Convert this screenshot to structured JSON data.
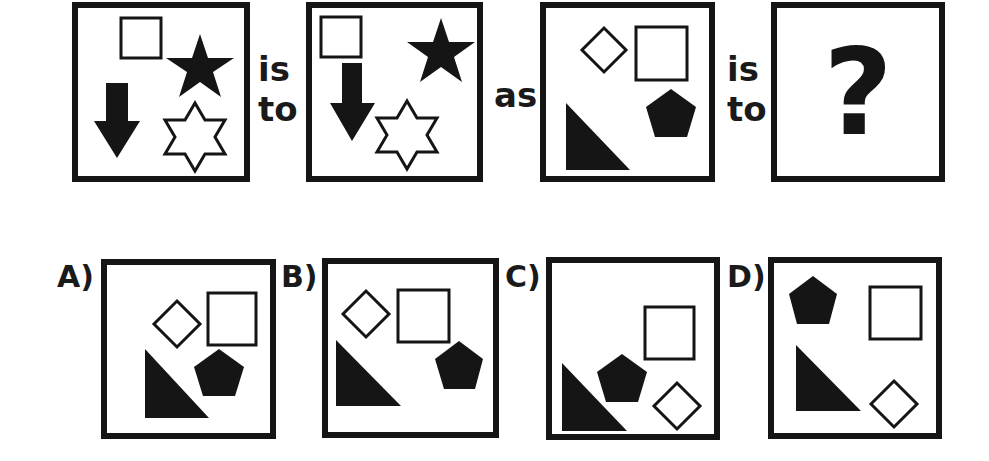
{
  "puzzle": {
    "connectors": {
      "first": {
        "line1": "is",
        "line2": "to"
      },
      "middle": "as",
      "second": {
        "line1": "is",
        "line2": "to"
      }
    },
    "unknown": "?",
    "options": [
      {
        "label": "A)"
      },
      {
        "label": "B)"
      },
      {
        "label": "C)"
      },
      {
        "label": "D)"
      }
    ]
  },
  "colors": {
    "ink": "#151515",
    "background": "#ffffff"
  }
}
